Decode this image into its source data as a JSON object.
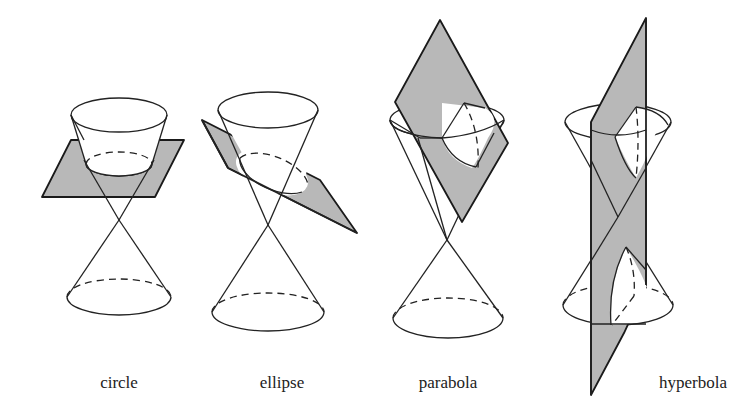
{
  "figure": {
    "background": "#ffffff",
    "plane_color": "#b8b8b8",
    "line_color": "#222222"
  },
  "panels": [
    {
      "id": "circle",
      "label": "circle",
      "description": "double cone cut by a horizontal plane"
    },
    {
      "id": "ellipse",
      "label": "ellipse",
      "description": "double cone cut by a tilted plane"
    },
    {
      "id": "parabola",
      "label": "parabola",
      "description": "double cone cut by a plane parallel to the slant"
    },
    {
      "id": "hyperbola",
      "label": "hyperbola",
      "description": "double cone cut by a vertical plane through both nappes"
    }
  ]
}
